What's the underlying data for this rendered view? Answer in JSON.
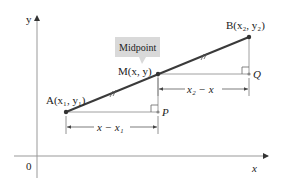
{
  "diagram": {
    "axes": {
      "x_label": "x",
      "y_label": "y",
      "origin_label": "0"
    },
    "points": {
      "A": {
        "label": "A(x₁, y₁)"
      },
      "M": {
        "label": "M(x, y)"
      },
      "B": {
        "label": "B(x₂, y₂)"
      },
      "P": {
        "label": "P"
      },
      "Q": {
        "label": "Q"
      }
    },
    "callout": {
      "label": "Midpoint"
    },
    "dimensions": {
      "lower": "x − x₁",
      "upper": "x₂ − x"
    },
    "colors": {
      "segment": "#3a3a3a",
      "guide": "#888888",
      "axis": "#999999",
      "callout_bg": "#d9d9d9"
    }
  }
}
